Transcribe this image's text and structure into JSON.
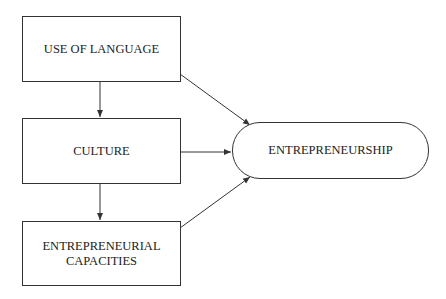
{
  "nodes": {
    "language": {
      "label": "USE OF LANGUAGE"
    },
    "culture": {
      "label": "CULTURE"
    },
    "capacities": {
      "label_line1": "ENTREPRENEURIAL",
      "label_line2": "CAPACITIES"
    },
    "entrepreneurship": {
      "label": "ENTREPRENEURSHIP"
    }
  },
  "edges": [
    {
      "from": "USE OF LANGUAGE",
      "to": "CULTURE"
    },
    {
      "from": "CULTURE",
      "to": "ENTREPRENEURIAL CAPACITIES"
    },
    {
      "from": "USE OF LANGUAGE",
      "to": "ENTREPRENEURSHIP"
    },
    {
      "from": "CULTURE",
      "to": "ENTREPRENEURSHIP"
    },
    {
      "from": "ENTREPRENEURIAL CAPACITIES",
      "to": "ENTREPRENEURSHIP"
    }
  ],
  "colors": {
    "stroke": "#333333",
    "background": "#ffffff"
  }
}
